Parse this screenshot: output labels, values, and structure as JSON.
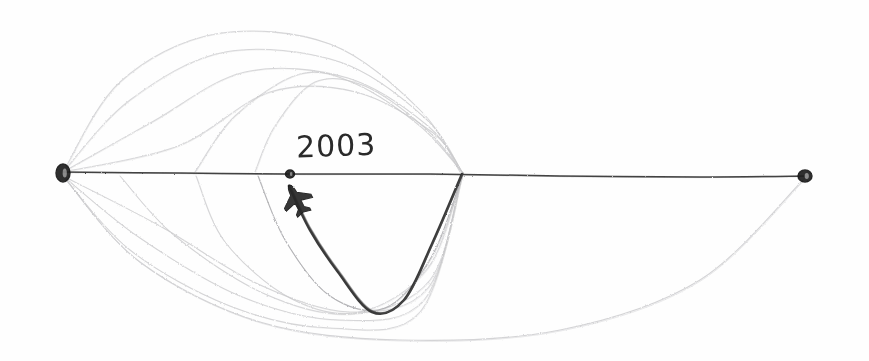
{
  "drawing": {
    "medium": "pencil sketch on white paper",
    "background_color": "#fefefe",
    "ink_color_dark": "#3a3a3a",
    "ink_color_faint": "#c9c9cc",
    "ink_color_mid": "#a9a9ad"
  },
  "labels": {
    "year": "2003"
  },
  "nodes": [
    {
      "name": "left-endpoint-node",
      "x": 63,
      "y": 173,
      "rx": 7,
      "ry": 9,
      "style": "filled-scribble"
    },
    {
      "name": "origin-node-2003",
      "x": 290,
      "y": 174,
      "rx": 4.5,
      "ry": 4,
      "style": "filled-scribble"
    },
    {
      "name": "right-endpoint-node",
      "x": 805,
      "y": 176,
      "rx": 7,
      "ry": 6,
      "style": "filled-scribble"
    }
  ],
  "horizontal_axis": {
    "name": "horizon-line",
    "from_x": 63,
    "from_y": 172,
    "to_x": 805,
    "to_y": 176
  },
  "airplane_marker": {
    "name": "airplane-icon",
    "x": 297,
    "y": 200,
    "rotation_deg": -28
  },
  "highlight_trajectory": {
    "name": "dark-descent-curve",
    "start": [
      289,
      186
    ],
    "low_point": [
      372,
      312
    ],
    "end": [
      462,
      174
    ]
  },
  "chart_data": {
    "type": "line",
    "title": "2003",
    "xlabel": "",
    "ylabel": "",
    "xlim": [
      0,
      869
    ],
    "ylim": [
      361,
      0
    ],
    "grid": false,
    "legend": null,
    "annotations": [
      {
        "text": "2003",
        "x": 300,
        "y": 150
      }
    ],
    "series": [
      {
        "name": "horizon-baseline",
        "kind": "baseline",
        "weight": "dark",
        "points": [
          [
            63,
            172
          ],
          [
            180,
            173
          ],
          [
            290,
            174
          ],
          [
            430,
            174
          ],
          [
            560,
            176
          ],
          [
            700,
            177
          ],
          [
            805,
            176
          ]
        ]
      },
      {
        "name": "dark-descent-curve",
        "kind": "trajectory",
        "weight": "dark",
        "points": [
          [
            289,
            186
          ],
          [
            310,
            230
          ],
          [
            338,
            272
          ],
          [
            372,
            312
          ],
          [
            404,
            300
          ],
          [
            432,
            244
          ],
          [
            462,
            174
          ]
        ]
      },
      {
        "name": "upper-arc-1",
        "kind": "meridian-upper",
        "weight": "faint",
        "points": [
          [
            63,
            172
          ],
          [
            120,
            82
          ],
          [
            215,
            34
          ],
          [
            330,
            44
          ],
          [
            420,
            110
          ],
          [
            460,
            172
          ]
        ]
      },
      {
        "name": "upper-arc-2",
        "kind": "meridian-upper",
        "weight": "faint",
        "points": [
          [
            63,
            172
          ],
          [
            130,
            100
          ],
          [
            225,
            52
          ],
          [
            340,
            62
          ],
          [
            425,
            118
          ],
          [
            462,
            172
          ]
        ]
      },
      {
        "name": "upper-arc-3",
        "kind": "meridian-upper",
        "weight": "faint",
        "points": [
          [
            63,
            172
          ],
          [
            152,
            122
          ],
          [
            245,
            72
          ],
          [
            348,
            78
          ],
          [
            428,
            126
          ],
          [
            462,
            172
          ]
        ]
      },
      {
        "name": "upper-arc-4",
        "kind": "meridian-upper",
        "weight": "faint",
        "points": [
          [
            63,
            172
          ],
          [
            178,
            146
          ],
          [
            270,
            92
          ],
          [
            356,
            92
          ],
          [
            432,
            132
          ],
          [
            462,
            172
          ]
        ]
      },
      {
        "name": "upper-arc-5",
        "kind": "meridian-upper",
        "weight": "faint",
        "points": [
          [
            195,
            172
          ],
          [
            235,
            116
          ],
          [
            300,
            74
          ],
          [
            356,
            84
          ],
          [
            420,
            126
          ],
          [
            462,
            172
          ]
        ]
      },
      {
        "name": "upper-arc-6",
        "kind": "meridian-upper",
        "weight": "faint",
        "points": [
          [
            255,
            172
          ],
          [
            275,
            126
          ],
          [
            315,
            82
          ],
          [
            365,
            86
          ],
          [
            425,
            128
          ],
          [
            462,
            172
          ]
        ]
      },
      {
        "name": "lower-arc-1",
        "kind": "meridian-lower",
        "weight": "faint",
        "points": [
          [
            63,
            176
          ],
          [
            130,
            250
          ],
          [
            230,
            306
          ],
          [
            330,
            328
          ],
          [
            420,
            312
          ],
          [
            462,
            176
          ]
        ]
      },
      {
        "name": "lower-arc-2",
        "kind": "meridian-lower",
        "weight": "faint",
        "points": [
          [
            63,
            176
          ],
          [
            140,
            238
          ],
          [
            240,
            296
          ],
          [
            340,
            320
          ],
          [
            424,
            300
          ],
          [
            462,
            176
          ]
        ]
      },
      {
        "name": "lower-arc-3",
        "kind": "meridian-lower",
        "weight": "faint",
        "points": [
          [
            63,
            176
          ],
          [
            160,
            226
          ],
          [
            258,
            284
          ],
          [
            350,
            312
          ],
          [
            428,
            288
          ],
          [
            462,
            176
          ]
        ]
      },
      {
        "name": "lower-arc-4",
        "kind": "meridian-lower",
        "weight": "faint",
        "points": [
          [
            120,
            176
          ],
          [
            175,
            236
          ],
          [
            265,
            294
          ],
          [
            352,
            314
          ],
          [
            430,
            280
          ],
          [
            462,
            176
          ]
        ]
      },
      {
        "name": "lower-arc-5",
        "kind": "meridian-lower",
        "weight": "faint",
        "points": [
          [
            196,
            176
          ],
          [
            225,
            242
          ],
          [
            290,
            298
          ],
          [
            360,
            312
          ],
          [
            428,
            268
          ],
          [
            462,
            176
          ]
        ]
      },
      {
        "name": "lower-arc-6",
        "kind": "meridian-lower",
        "weight": "mid",
        "points": [
          [
            258,
            176
          ],
          [
            285,
            240
          ],
          [
            330,
            296
          ],
          [
            385,
            308
          ],
          [
            432,
            256
          ],
          [
            462,
            176
          ]
        ]
      },
      {
        "name": "outer-sweep-arc",
        "kind": "outer-sweep",
        "weight": "faint",
        "points": [
          [
            63,
            176
          ],
          [
            140,
            262
          ],
          [
            260,
            322
          ],
          [
            400,
            340
          ],
          [
            560,
            330
          ],
          [
            700,
            280
          ],
          [
            805,
            178
          ]
        ]
      }
    ]
  }
}
